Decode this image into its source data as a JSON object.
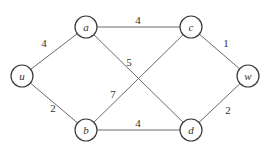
{
  "graph": {
    "nodes": [
      {
        "id": "u",
        "label": "u"
      },
      {
        "id": "a",
        "label": "a"
      },
      {
        "id": "b",
        "label": "b"
      },
      {
        "id": "c",
        "label": "c"
      },
      {
        "id": "d",
        "label": "d"
      },
      {
        "id": "w",
        "label": "w"
      }
    ],
    "edges": [
      {
        "from": "u",
        "to": "a",
        "weight": "4"
      },
      {
        "from": "u",
        "to": "b",
        "weight": "2"
      },
      {
        "from": "a",
        "to": "c",
        "weight": "4"
      },
      {
        "from": "a",
        "to": "d",
        "weight": "5"
      },
      {
        "from": "b",
        "to": "c",
        "weight": "7"
      },
      {
        "from": "b",
        "to": "d",
        "weight": "4"
      },
      {
        "from": "c",
        "to": "w",
        "weight": "1"
      },
      {
        "from": "d",
        "to": "w",
        "weight": "2"
      }
    ]
  }
}
